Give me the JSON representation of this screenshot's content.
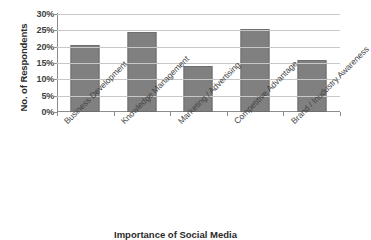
{
  "chart_data": {
    "type": "bar",
    "title": "",
    "xlabel": "Importance of Social Media",
    "ylabel": "No. of Respondents",
    "categories": [
      "Business Development",
      "Knowledge Management",
      "Marketing / Advertising",
      "Competitive Advantage",
      "Brand / Inudustry Awareness"
    ],
    "values": [
      20.5,
      24.5,
      14.0,
      25.5,
      15.8
    ],
    "value_suffix": "%",
    "ylim": [
      0,
      30
    ],
    "ytick_values": [
      30,
      25,
      20,
      15,
      10,
      5,
      0
    ],
    "ytick_labels": [
      "30%",
      "25%",
      "20%",
      "15%",
      "10%",
      "5%",
      "0%"
    ],
    "grid": true,
    "grid_axis": "y",
    "legend": false,
    "bar_color": "#808080",
    "gridline_color": "#c8c8c8",
    "axis_color": "#8c8c8c"
  }
}
